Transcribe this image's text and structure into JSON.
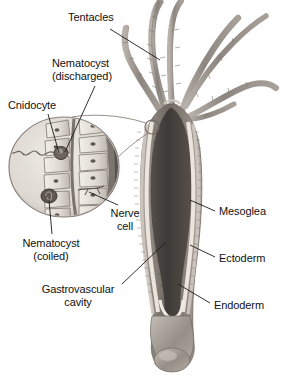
{
  "figure": {
    "background_color": "#ffffff",
    "width": 287,
    "height": 378
  },
  "palette": {
    "body_dark": "#4a4441",
    "body_mid": "#8d8580",
    "body_light": "#c9c3bc",
    "tentacle": "#9a938c",
    "cavity": "#43403d",
    "mesoglea": "#e8e4dc",
    "ectoderm": "#b9b2aa",
    "endoderm": "#6d6661",
    "inset_fill": "#cfc9c2",
    "inset_stroke": "#8a837c",
    "leader_line": "#1b1b1b",
    "text": "#111111"
  },
  "labels": [
    {
      "id": "tentacles",
      "text": "Tentacles",
      "x": 68,
      "y": 11,
      "align": "lft",
      "leader": {
        "x1": 110,
        "y1": 29,
        "x2": 160,
        "y2": 60
      }
    },
    {
      "id": "nematocyst-discharged",
      "line1": "Nematocyst",
      "line2": "(discharged)",
      "text": "Nematocyst\n(discharged)",
      "x": 52,
      "y": 57,
      "align": "lft",
      "leader": {
        "x1": 95,
        "y1": 86,
        "x2": 65,
        "y2": 152
      }
    },
    {
      "id": "cnidocyte",
      "text": "Cnidocyte",
      "x": 8,
      "y": 99,
      "align": "lft",
      "leader": {
        "x1": 48,
        "y1": 114,
        "x2": 59,
        "y2": 153
      }
    },
    {
      "id": "nerve-cell",
      "line1": "Nerve",
      "line2": "cell",
      "text": "Nerve\ncell",
      "x": 104,
      "y": 207,
      "align": "ctr",
      "leader": {
        "x1": 118,
        "y1": 205,
        "x2": 89,
        "y2": 192
      }
    },
    {
      "id": "nematocyst-coiled",
      "line1": "Nematocyst",
      "line2": "(coiled)",
      "text": "Nematocyst\n(coiled)",
      "x": 10,
      "y": 237,
      "align": "ctr",
      "leader": {
        "x1": 52,
        "y1": 234,
        "x2": 49,
        "y2": 196
      }
    },
    {
      "id": "gastrovascular-cavity",
      "line1": "Gastrovascular",
      "line2": "cavity",
      "text": "Gastrovascular\ncavity",
      "x": 35,
      "y": 283,
      "align": "ctr",
      "leader": {
        "x1": 122,
        "y1": 284,
        "x2": 165,
        "y2": 243
      }
    },
    {
      "id": "mesoglea",
      "text": "Mesoglea",
      "x": 219,
      "y": 205,
      "align": "lft",
      "leader": {
        "x1": 215,
        "y1": 211,
        "x2": 190,
        "y2": 200
      }
    },
    {
      "id": "ectoderm",
      "text": "Ectoderm",
      "x": 219,
      "y": 252,
      "align": "lft",
      "leader": {
        "x1": 215,
        "y1": 257,
        "x2": 190,
        "y2": 245
      }
    },
    {
      "id": "endoderm",
      "text": "Endoderm",
      "x": 214,
      "y": 299,
      "align": "lft",
      "leader": {
        "x1": 210,
        "y1": 303,
        "x2": 178,
        "y2": 284
      }
    }
  ],
  "inset": {
    "name": "cnidocyte-inset",
    "center_x": 64,
    "center_y": 167,
    "radius_x": 55,
    "radius_y": 50,
    "cell_count": 8,
    "nematocyst_discharged": {
      "x": 61,
      "y": 152
    },
    "nematocyst_coiled": {
      "x": 49,
      "y": 196
    },
    "thread_label": "discharged-thread"
  },
  "hydra": {
    "name": "hydra-body",
    "tentacle_count": 6,
    "body_top_y": 100,
    "body_bottom_y": 368,
    "basal_disc_y": 352
  }
}
